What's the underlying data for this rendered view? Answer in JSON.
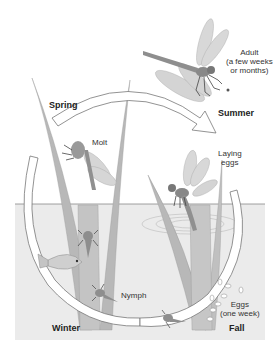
{
  "diagram": {
    "seasons": {
      "spring": "Spring",
      "summer": "Summer",
      "fall": "Fall",
      "winter": "Winter"
    },
    "stages": {
      "adult_label": "Adult",
      "adult_duration_line1": "(a few weeks",
      "adult_duration_line2": "or months)",
      "molt": "Molt",
      "laying_line1": "Laying",
      "laying_line2": "eggs",
      "nymph": "Nymph",
      "eggs_label": "Eggs",
      "eggs_duration": "(one week)"
    },
    "colors": {
      "water": "#e9e9e9",
      "waterline": "#8a8a8a",
      "reed": "#b9b9b9",
      "reed_dark": "#a4a4a4",
      "arrow_fill": "#ffffff",
      "arrow_stroke": "#777777",
      "insect": "#8f8f8f",
      "wing": "#d7d7d7"
    }
  }
}
